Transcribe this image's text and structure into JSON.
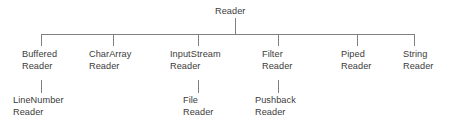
{
  "diagram": {
    "type": "tree",
    "background_color": "#ffffff",
    "line_color": "#808080",
    "text_color": "#3b3b3b",
    "root": {
      "id": "reader",
      "label_line1": "Reader",
      "label_line2": "",
      "x": 235,
      "label_x": 215,
      "label_y": 6
    },
    "children": [
      {
        "id": "buffered-reader",
        "label_line1": "Buffered",
        "label_line2": "Reader",
        "stem_x": 41,
        "label_x": 22,
        "label_y": 49
      },
      {
        "id": "chararray-reader",
        "label_line1": "CharArray",
        "label_line2": "Reader",
        "stem_x": 113,
        "label_x": 89,
        "label_y": 49
      },
      {
        "id": "inputstream-reader",
        "label_line1": "InputStream",
        "label_line2": "Reader",
        "stem_x": 198,
        "label_x": 170,
        "label_y": 49
      },
      {
        "id": "filter-reader",
        "label_line1": "Filter",
        "label_line2": "Reader",
        "stem_x": 278,
        "label_x": 262,
        "label_y": 49
      },
      {
        "id": "piped-reader",
        "label_line1": "Piped",
        "label_line2": "Reader",
        "stem_x": 357,
        "label_x": 341,
        "label_y": 49
      },
      {
        "id": "string-reader",
        "label_line1": "String",
        "label_line2": "Reader",
        "stem_x": 414,
        "label_x": 403,
        "label_y": 49
      }
    ],
    "grandchildren": [
      {
        "id": "linenumber-reader",
        "parent": "buffered-reader",
        "label_line1": "LineNumber",
        "label_line2": "Reader",
        "stem_x": 41,
        "label_x": 13,
        "label_y": 95
      },
      {
        "id": "file-reader",
        "parent": "inputstream-reader",
        "label_line1": "File",
        "label_line2": "Reader",
        "stem_x": 198,
        "label_x": 183,
        "label_y": 95
      },
      {
        "id": "pushback-reader",
        "parent": "filter-reader",
        "label_line1": "Pushback",
        "label_line2": "Reader",
        "stem_x": 278,
        "label_x": 255,
        "label_y": 95
      }
    ],
    "geometry": {
      "bus_y": 34,
      "bus_x_start": 41,
      "bus_x_end": 414,
      "root_stem_top": 18,
      "child_stem_bottom": 46,
      "grandchild_stem_top": 80,
      "grandchild_stem_bottom": 93
    }
  }
}
